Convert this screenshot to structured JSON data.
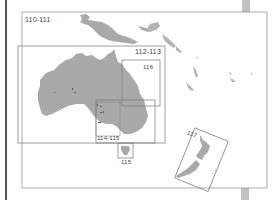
{
  "map": {
    "type": "locator-index-map",
    "region": "Australia and Oceania",
    "colors": {
      "land": "#a9a9a9",
      "frame": "#7a7a7a",
      "page_edge": "#555555",
      "background": "#ffffff"
    },
    "frames": [
      {
        "id": "110-111",
        "label": "110-111"
      },
      {
        "id": "112-113",
        "label": "112-113"
      },
      {
        "id": "116",
        "label": "116"
      },
      {
        "id": "114-115",
        "label": "114-115"
      },
      {
        "id": "115",
        "label": "115"
      },
      {
        "id": "117",
        "label": "117"
      }
    ]
  }
}
